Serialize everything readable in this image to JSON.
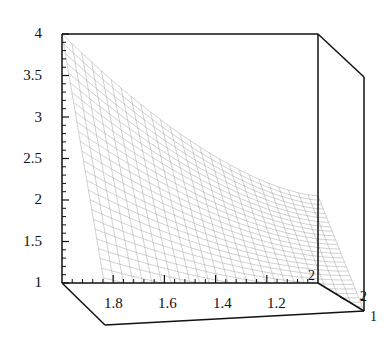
{
  "figure": {
    "kind": "3d-surface-mesh-plot",
    "background_color": "#ffffff",
    "line_color": "#000000",
    "mesh_color": "#9a9a9a",
    "width": 392,
    "height": 353
  },
  "chart_data": {
    "type": "line",
    "render_style": "3d wireframe surface (Mathematica Plot3D style)",
    "title": "",
    "xlabel": "",
    "ylabel": "",
    "zlabel": "",
    "grid": false,
    "legend": false,
    "axes": {
      "vertical": {
        "name": "z-axis",
        "ticks": [
          1,
          1.5,
          2,
          2.5,
          3,
          3.5,
          4
        ],
        "tick_labels": [
          "1",
          "1.5",
          "2",
          "2.5",
          "3",
          "3.5",
          "4"
        ],
        "range": [
          1,
          4
        ],
        "minor_ticks_per_interval": 4,
        "position": "left"
      },
      "bottom_front": {
        "name": "x-axis",
        "ticks": [
          1.8,
          1.6,
          1.4,
          1.2
        ],
        "tick_labels": [
          "1.8",
          "1.6",
          "1.4",
          "1.2"
        ],
        "range": [
          2.0,
          1.0
        ],
        "direction": "decreasing left to right",
        "minor_ticks_per_interval": 4,
        "position": "bottom"
      },
      "depth_right": {
        "name": "y-axis",
        "ticks": [
          2,
          1
        ],
        "tick_labels": [
          "2",
          "1"
        ],
        "range": [
          2,
          1
        ],
        "position": "bottom-right"
      }
    },
    "tick_label_positions": {
      "vertical": [
        {
          "label": "4",
          "x": 44,
          "y": 34
        },
        {
          "label": "3.5",
          "x": 44,
          "y": 76
        },
        {
          "label": "3",
          "x": 44,
          "y": 118
        },
        {
          "label": "2.5",
          "x": 44,
          "y": 159
        },
        {
          "label": "2",
          "x": 44,
          "y": 200
        },
        {
          "label": "1.5",
          "x": 44,
          "y": 242
        },
        {
          "label": "1",
          "x": 44,
          "y": 283
        }
      ],
      "bottom": [
        {
          "label": "1.8",
          "x": 119,
          "y": 303
        },
        {
          "label": "1.6",
          "x": 173,
          "y": 303
        },
        {
          "label": "1.4",
          "x": 228,
          "y": 303
        },
        {
          "label": "1.2",
          "x": 282,
          "y": 303
        }
      ],
      "depth": [
        {
          "label": "2",
          "x": 313,
          "y": 277
        },
        {
          "label": "2",
          "x": 366,
          "y": 298
        },
        {
          "label": "1",
          "x": 373,
          "y": 318
        }
      ]
    },
    "surface": {
      "description": "Monotone decreasing planar-like mesh sheet spanning from a high left edge near z=4 down to the front-right corner near z=1",
      "mesh_rows": 26,
      "mesh_cols": 26,
      "corner_values_z": {
        "back_left": 4.0,
        "back_right": 2.05,
        "front_left": 1.45,
        "front_right": 1.0
      }
    }
  }
}
